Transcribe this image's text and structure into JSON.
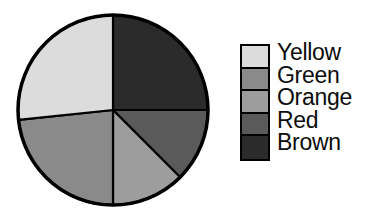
{
  "chart_data": {
    "type": "pie",
    "title": "",
    "categories": [
      "Yellow",
      "Green",
      "Orange",
      "Red",
      "Brown"
    ],
    "values": [
      26.7,
      23.3,
      12.5,
      12.5,
      25.0
    ],
    "unit": "percent",
    "legend_position": "right",
    "start_angle_deg": 0,
    "direction": "clockwise",
    "slices": [
      {
        "label": "Brown",
        "value": 25.0,
        "start_angle_deg": 0,
        "end_angle_deg": 90,
        "fill": "#2b2b2b",
        "stroke": "#000000"
      },
      {
        "label": "Red",
        "value": 12.5,
        "start_angle_deg": 90,
        "end_angle_deg": 135,
        "fill": "#5a5a5a",
        "stroke": "#000000"
      },
      {
        "label": "Orange",
        "value": 12.5,
        "start_angle_deg": 135,
        "end_angle_deg": 180,
        "fill": "#9d9d9d",
        "stroke": "#000000"
      },
      {
        "label": "Green",
        "value": 23.3,
        "start_angle_deg": 180,
        "end_angle_deg": 264,
        "fill": "#8a8a8a",
        "stroke": "#000000"
      },
      {
        "label": "Yellow",
        "value": 26.7,
        "start_angle_deg": 264,
        "end_angle_deg": 360,
        "fill": "#dcdcdc",
        "stroke": "#000000"
      }
    ],
    "geometry": {
      "center_x": 99,
      "center_y": 102,
      "radius": 95,
      "outline_color": "#000000",
      "outline_width": 3.5
    }
  },
  "legend": {
    "items": [
      {
        "label": "Yellow",
        "color": "#dcdcdc"
      },
      {
        "label": "Green",
        "color": "#8a8a8a"
      },
      {
        "label": "Orange",
        "color": "#9d9d9d"
      },
      {
        "label": "Red",
        "color": "#5a5a5a"
      },
      {
        "label": "Brown",
        "color": "#2b2b2b"
      }
    ]
  },
  "canvas": {
    "background": "#ffffff",
    "text_color": "#0c0c0c"
  }
}
